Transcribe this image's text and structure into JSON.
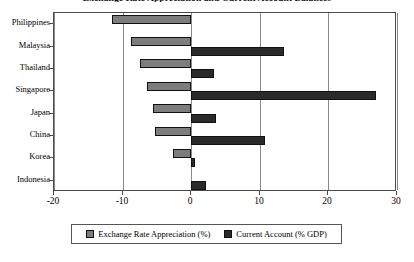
{
  "chart_data": {
    "type": "bar",
    "orientation": "horizontal",
    "title": "Exchange Rate Appreciation and Current Account Balances",
    "xlabel": "",
    "ylabel": "",
    "xlim": [
      -20,
      30
    ],
    "xticks": [
      -20,
      -10,
      0,
      10,
      20,
      30
    ],
    "xtick_labels": [
      "-20",
      "-10",
      "0",
      "10",
      "20",
      "30"
    ],
    "grid": true,
    "grid_axis": "x",
    "legend_position": "bottom",
    "categories": [
      "Philippines",
      "Malaysia",
      "Thailand",
      "Singapore",
      "Japan",
      "China",
      "Korea",
      "Indonesia"
    ],
    "series": [
      {
        "name": "Exchange Rate Appreciation (%)",
        "color": "#7d7d7d",
        "values": [
          -11.5,
          -8.8,
          -7.5,
          -6.5,
          -5.5,
          -5.3,
          -2.6,
          0
        ]
      },
      {
        "name": "Current Account (% GDP)",
        "color": "#2a2a2a",
        "values": [
          0,
          13.5,
          3.3,
          27.0,
          3.6,
          10.8,
          0.6,
          2.2
        ]
      }
    ]
  },
  "legend": {
    "items": [
      {
        "label": "Exchange Rate Appreciation (%)"
      },
      {
        "label": "Current Account (% GDP)"
      }
    ]
  }
}
